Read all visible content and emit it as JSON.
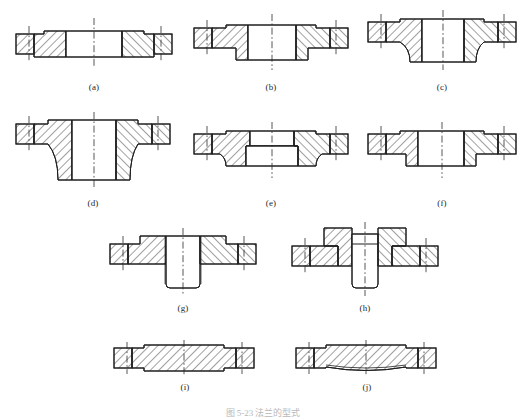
{
  "document": {
    "type": "engineering-drawing",
    "title_caption": "图 5-23  法兰的型式",
    "figure_count": 10
  },
  "figures": [
    {
      "id": "a",
      "label": "(a)",
      "name": "flat-welding-flange-plate-type",
      "x": 14,
      "y": 14,
      "w": 160,
      "h": 58,
      "label_x": 14,
      "label_y": 82,
      "label_w": 160
    },
    {
      "id": "b",
      "label": "(b)",
      "name": "flat-welding-flange-raised-hub",
      "x": 192,
      "y": 10,
      "w": 158,
      "h": 64,
      "label_x": 192,
      "label_y": 82,
      "label_w": 158
    },
    {
      "id": "c",
      "label": "(c)",
      "name": "welding-neck-flange-short-neck",
      "x": 366,
      "y": 8,
      "w": 152,
      "h": 66,
      "label_x": 366,
      "label_y": 82,
      "label_w": 152
    },
    {
      "id": "d",
      "label": "(d)",
      "name": "welding-neck-flange-long-neck",
      "x": 14,
      "y": 112,
      "w": 158,
      "h": 80,
      "label_x": 14,
      "label_y": 198,
      "label_w": 158
    },
    {
      "id": "e",
      "label": "(e)",
      "name": "socket-welding-flange",
      "x": 192,
      "y": 120,
      "w": 158,
      "h": 62,
      "label_x": 192,
      "label_y": 198,
      "label_w": 158
    },
    {
      "id": "f",
      "label": "(f)",
      "name": "lap-joint-stub-end-flange",
      "x": 366,
      "y": 120,
      "w": 152,
      "h": 62,
      "label_x": 366,
      "label_y": 198,
      "label_w": 152
    },
    {
      "id": "g",
      "label": "(g)",
      "name": "threaded-flange",
      "x": 108,
      "y": 226,
      "w": 150,
      "h": 72,
      "label_x": 108,
      "label_y": 303,
      "label_w": 150
    },
    {
      "id": "h",
      "label": "(h)",
      "name": "loose-flange-with-collar",
      "x": 290,
      "y": 222,
      "w": 150,
      "h": 76,
      "label_x": 290,
      "label_y": 303,
      "label_w": 150
    },
    {
      "id": "i",
      "label": "(i)",
      "name": "blind-flange-flat-face",
      "x": 112,
      "y": 340,
      "w": 146,
      "h": 36,
      "label_x": 112,
      "label_y": 382,
      "label_w": 146
    },
    {
      "id": "j",
      "label": "(j)",
      "name": "blind-flange-concave-face",
      "x": 294,
      "y": 340,
      "w": 146,
      "h": 36,
      "label_x": 294,
      "label_y": 382,
      "label_w": 146
    }
  ],
  "style": {
    "line_color": "#1f1f1f",
    "hatch_color": "#2b2b2b",
    "centerline_color": "#2b2b2b",
    "background": "#ffffff"
  }
}
